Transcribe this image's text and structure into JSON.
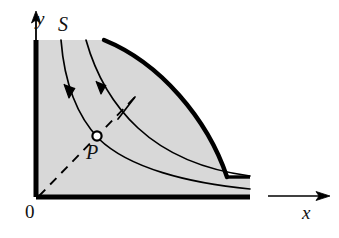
{
  "figure": {
    "kind": "phase-portrait-diagram",
    "background_color": "#ffffff",
    "shaded_region": {
      "name": "S",
      "fill_color": "#d8d8d8",
      "stroke_color": "#000000"
    },
    "labels": {
      "y_axis": "y",
      "x_axis": "x",
      "origin": "0",
      "region": "S",
      "point": "P"
    },
    "axes": {
      "color": "#000000",
      "y_axis_arrow": true,
      "x_axis_arrow": true,
      "x_axis_label_position": "right",
      "y_axis_label_position": "top"
    },
    "curves": [
      {
        "name": "inner-trajectory",
        "style": "solid",
        "width": 1.6,
        "arrow": true,
        "color": "#000000"
      },
      {
        "name": "middle-trajectory",
        "style": "solid",
        "width": 1.6,
        "arrow": true,
        "color": "#000000"
      },
      {
        "name": "boundary-trajectory",
        "style": "solid",
        "width": 4.2,
        "arrow": false,
        "color": "#000000"
      }
    ],
    "radial_line": {
      "name": "dashed-ray-from-origin",
      "style": "dashed",
      "color": "#000000",
      "passes_through": "P"
    },
    "marker_point": {
      "name": "P",
      "style": "open-circle",
      "fill": "#ffffff",
      "stroke": "#000000"
    },
    "tick_mark": {
      "name": "transversal-tick",
      "style": "solid",
      "color": "#000000"
    }
  }
}
